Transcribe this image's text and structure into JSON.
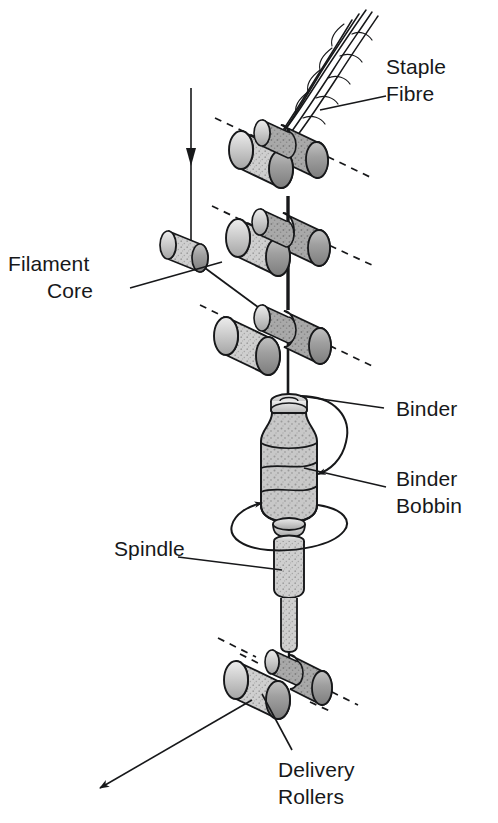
{
  "figure": {
    "background_color": "#ffffff",
    "ink_color": "#17181a"
  },
  "labels": {
    "staple_fibre_line1": "Staple",
    "staple_fibre_line2": "Fibre",
    "filament_core_line1": "Filament",
    "filament_core_line2": "Core",
    "binder": "Binder",
    "binder_bobbin_line1": "Binder",
    "binder_bobbin_line2": "Bobbin",
    "spindle": "Spindle",
    "delivery_rollers_line1": "Delivery",
    "delivery_rollers_line2": "Rollers"
  },
  "components": {
    "roller_pairs": [
      {
        "name": "top-roller-pair",
        "role": "staple fibre drafting rollers"
      },
      {
        "name": "middle-roller-pair",
        "role": "drafting rollers"
      },
      {
        "name": "bottom-roller-pair",
        "role": "front drafting rollers"
      },
      {
        "name": "delivery-roller-pair",
        "role": "delivery rollers"
      }
    ],
    "filament_guide": {
      "name": "filament-guide-roller"
    },
    "binder_bobbin": {
      "name": "binder-bobbin",
      "rotation": "clockwise"
    },
    "spindle": {
      "name": "spindle",
      "rotation": "clockwise"
    },
    "staple_fibre_strand": {
      "name": "staple-fibre-strand",
      "strand_count": 5
    },
    "feed_arrow": {
      "name": "filament-feed-arrow",
      "direction": "down"
    },
    "delivery_arrow": {
      "name": "yarn-delivery-arrow",
      "direction": "down-left"
    }
  },
  "colors": {
    "roller_light": "#d8d8d8",
    "roller_mid": "#b4b4b4",
    "roller_dark": "#8f8f8f",
    "bobbin_fill": "#c9c9c9",
    "outline": "#17181a"
  }
}
